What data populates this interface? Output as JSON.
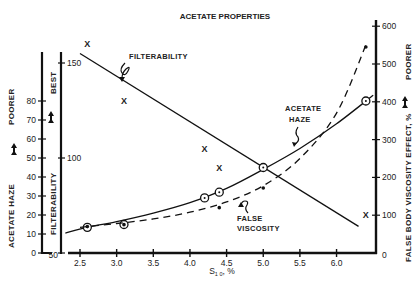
{
  "chart_data": {
    "type": "line",
    "title": "ACETATE PROPERTIES",
    "xlabel": "S₁₀, %",
    "xlim": [
      2.25,
      6.5
    ],
    "xticks": [
      2.5,
      3.0,
      3.5,
      4.0,
      4.5,
      5.0,
      5.5,
      6.0
    ],
    "xtick_labels": [
      "2.5",
      "3.0",
      "3.5",
      "4.0",
      "4.5",
      "5.0",
      "5.5",
      "6.0"
    ],
    "grid": false,
    "legend": "none (inline annotations)",
    "axes": {
      "left_outer": {
        "label": "ACETATE HAZE",
        "direction_label": "POORER",
        "ylim": [
          0,
          80
        ],
        "ticks": [
          0,
          10,
          20,
          30,
          40,
          50,
          60,
          70,
          80
        ]
      },
      "left_inner": {
        "label": "FILTERABILITY",
        "direction_label": "BEST",
        "ylim": [
          50,
          160
        ],
        "ticks": [
          50,
          100,
          150
        ]
      },
      "right": {
        "label": "FALSE BODY VISCOSITY EFFECT, %",
        "direction_label": "POORER",
        "ylim": [
          0,
          600
        ],
        "ticks": [
          0,
          100,
          200,
          300,
          400,
          500,
          600
        ]
      }
    },
    "series": [
      {
        "name": "FILTERABILITY",
        "axis": "left_inner",
        "marker": "x",
        "line_style": "solid",
        "points": [
          {
            "x": 2.6,
            "y": 160
          },
          {
            "x": 3.1,
            "y": 130
          },
          {
            "x": 4.2,
            "y": 105
          },
          {
            "x": 4.4,
            "y": 95
          },
          {
            "x": 6.4,
            "y": 70
          }
        ],
        "fit_line": [
          {
            "x": 2.5,
            "y": 155
          },
          {
            "x": 6.3,
            "y": 64
          }
        ]
      },
      {
        "name": "ACETATE HAZE",
        "axis": "left_outer",
        "marker": "circle",
        "line_style": "solid",
        "points": [
          {
            "x": 2.6,
            "y": 13.5
          },
          {
            "x": 3.1,
            "y": 15
          },
          {
            "x": 4.2,
            "y": 29
          },
          {
            "x": 4.4,
            "y": 32
          },
          {
            "x": 5.0,
            "y": 45
          },
          {
            "x": 6.4,
            "y": 80
          }
        ],
        "fit_curve": [
          {
            "x": 2.3,
            "y": 10.5
          },
          {
            "x": 2.6,
            "y": 13.5
          },
          {
            "x": 3.0,
            "y": 16.5
          },
          {
            "x": 3.5,
            "y": 21
          },
          {
            "x": 4.0,
            "y": 26.5
          },
          {
            "x": 4.5,
            "y": 34
          },
          {
            "x": 5.0,
            "y": 44
          },
          {
            "x": 5.5,
            "y": 55
          },
          {
            "x": 6.0,
            "y": 68
          },
          {
            "x": 6.5,
            "y": 83
          }
        ]
      },
      {
        "name": "FALSE VISCOSITY",
        "axis": "right",
        "marker": "dot",
        "line_style": "dashed",
        "points": [
          {
            "x": 2.6,
            "y": 70
          },
          {
            "x": 3.1,
            "y": 75
          },
          {
            "x": 4.4,
            "y": 120
          },
          {
            "x": 5.0,
            "y": 172
          },
          {
            "x": 6.4,
            "y": 545
          }
        ],
        "fit_curve": [
          {
            "x": 2.5,
            "y": 68
          },
          {
            "x": 3.0,
            "y": 78
          },
          {
            "x": 3.5,
            "y": 90
          },
          {
            "x": 4.0,
            "y": 108
          },
          {
            "x": 4.5,
            "y": 135
          },
          {
            "x": 5.0,
            "y": 178
          },
          {
            "x": 5.5,
            "y": 250
          },
          {
            "x": 6.0,
            "y": 370
          },
          {
            "x": 6.4,
            "y": 550
          }
        ]
      }
    ],
    "annotations": [
      "FILTERABILITY",
      "ACETATE\nHAZE",
      "FALSE\nVISCOSITY"
    ]
  },
  "labels": {
    "title": "ACETATE PROPERTIES",
    "x_axis_label": "S",
    "x_axis_sub": "1 0",
    "x_axis_unit": ", %",
    "haze_axis": "ACETATE HAZE",
    "haze_dir": "POORER",
    "filt_axis": "FILTERABILITY",
    "filt_dir": "BEST",
    "fbv_axis": "FALSE BODY VISCOSITY EFFECT, %",
    "fbv_dir": "POORER",
    "annot_filt": "FILTERABILITY",
    "annot_haze_1": "ACETATE",
    "annot_haze_2": "HAZE",
    "annot_fv_1": "FALSE",
    "annot_fv_2": "VISCOSITY"
  }
}
